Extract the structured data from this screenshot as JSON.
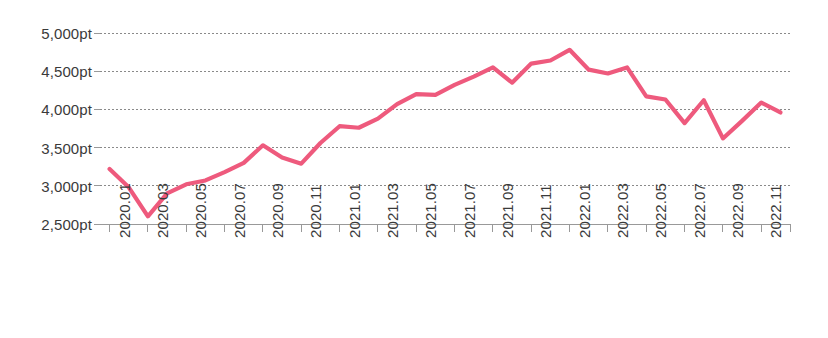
{
  "chart_data": {
    "type": "line",
    "title": "",
    "subtitle": "",
    "xlabel": "",
    "ylabel": "",
    "unit": "pt",
    "grid": true,
    "legend": "none",
    "line_color": "#ee5a7d",
    "axis_color": "#999999",
    "gridline_color": "#8a8a8a",
    "label_color": "#3a3a3a",
    "ylim": [
      2500,
      5000
    ],
    "ytick_step": 500,
    "ytick_labels": [
      "5,000pt",
      "4,500pt",
      "4,000pt",
      "3,500pt",
      "3,000pt",
      "2,500pt"
    ],
    "ytick_values": [
      5000,
      4500,
      4000,
      3500,
      3000,
      2500
    ],
    "xtick_labels": [
      "2020.01",
      "2020.03",
      "2020.05",
      "2020.07",
      "2020.09",
      "2020.11",
      "2021.01",
      "2021.03",
      "2021.05",
      "2021.07",
      "2021.09",
      "2021.11",
      "2022.01",
      "2022.03",
      "2022.05",
      "2022.07",
      "2022.09",
      "2022.11"
    ],
    "xtick_label_interval_months": 2,
    "x": [
      "2020.01",
      "2020.02",
      "2020.03",
      "2020.04",
      "2020.05",
      "2020.06",
      "2020.07",
      "2020.08",
      "2020.09",
      "2020.10",
      "2020.11",
      "2020.12",
      "2021.01",
      "2021.02",
      "2021.03",
      "2021.04",
      "2021.05",
      "2021.06",
      "2021.07",
      "2021.08",
      "2021.09",
      "2021.10",
      "2021.11",
      "2021.12",
      "2022.01",
      "2022.02",
      "2022.03",
      "2022.04",
      "2022.05",
      "2022.06",
      "2022.07",
      "2022.08",
      "2022.09",
      "2022.10",
      "2022.11",
      "2022.12"
    ],
    "values": [
      3220,
      2980,
      2600,
      2900,
      3020,
      3070,
      3180,
      3300,
      3530,
      3370,
      3290,
      3560,
      3780,
      3760,
      3880,
      4070,
      4200,
      4190,
      4320,
      4430,
      4550,
      4350,
      4600,
      4640,
      4780,
      4520,
      4470,
      4550,
      4170,
      4130,
      3820,
      4120,
      3620,
      3850,
      4090,
      3960
    ],
    "values_unit_suffix": "pt",
    "series_name": ""
  }
}
